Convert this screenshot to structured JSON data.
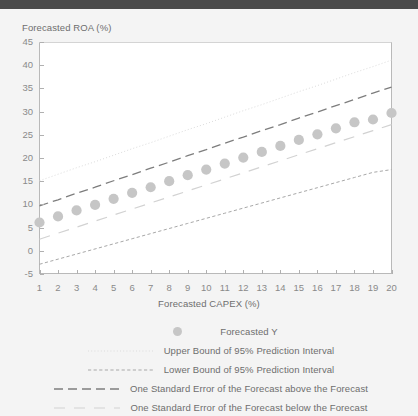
{
  "window": {
    "titlebar_color": "#4a4a4a",
    "background_color": "#f4f4f4"
  },
  "chart_data": {
    "type": "scatter",
    "title": "",
    "xlabel": "Forecasted CAPEX (%)",
    "ylabel": "Forecasted ROA (%)",
    "xlim": [
      1,
      20
    ],
    "ylim": [
      -5,
      45
    ],
    "ytick_labels": [
      "45",
      "40",
      "35",
      "30",
      "25",
      "20",
      "15",
      "10",
      "5",
      "0",
      "-5"
    ],
    "ytick_values": [
      45,
      40,
      35,
      30,
      25,
      20,
      15,
      10,
      5,
      0,
      -5
    ],
    "xtick_labels": [
      "1",
      "2",
      "3",
      "4",
      "5",
      "6",
      "7",
      "8",
      "9",
      "10",
      "11",
      "12",
      "13",
      "14",
      "15",
      "16",
      "17",
      "18",
      "19",
      "20"
    ],
    "xtick_values": [
      1,
      2,
      3,
      4,
      5,
      6,
      7,
      8,
      9,
      10,
      11,
      12,
      13,
      14,
      15,
      16,
      17,
      18,
      19,
      20
    ],
    "grid": false,
    "legend_position": "bottom",
    "x": [
      1,
      2,
      3,
      4,
      5,
      6,
      7,
      8,
      9,
      10,
      11,
      12,
      13,
      14,
      15,
      16,
      17,
      18,
      19,
      20
    ],
    "series": [
      {
        "name": "Forecasted Y",
        "style": "markers",
        "marker": "circle",
        "color": "#c6c6c6",
        "values": [
          6.1,
          7.4,
          8.7,
          9.9,
          11.2,
          12.5,
          13.7,
          15.0,
          16.3,
          17.5,
          18.8,
          20.1,
          21.3,
          22.6,
          23.9,
          25.1,
          26.4,
          27.7,
          28.3,
          29.7
        ]
      },
      {
        "name": "Upper Bound of 95% Prediction Interval",
        "style": "dotted",
        "color": "#dcdcdc",
        "values": [
          15.1,
          16.5,
          17.9,
          19.2,
          20.6,
          22.0,
          23.3,
          24.7,
          26.1,
          27.4,
          28.8,
          30.2,
          31.5,
          32.9,
          34.3,
          35.6,
          37.0,
          38.4,
          39.7,
          41.1
        ]
      },
      {
        "name": "Lower Bound of 95% Prediction Interval",
        "style": "dashed-fine",
        "color": "#a8a8a8",
        "values": [
          -2.9,
          -1.8,
          -0.7,
          0.4,
          1.5,
          2.6,
          3.7,
          4.8,
          5.9,
          7.0,
          8.1,
          9.2,
          10.3,
          11.4,
          12.5,
          13.6,
          14.7,
          15.8,
          16.9,
          17.5
        ]
      },
      {
        "name": "One Standard Error of the Forecast above the Forecast",
        "style": "dashed-long",
        "color": "#7d7d7d",
        "values": [
          9.7,
          11.0,
          12.4,
          13.7,
          15.1,
          16.4,
          17.8,
          19.1,
          20.5,
          21.8,
          23.2,
          24.5,
          25.9,
          27.2,
          28.6,
          29.9,
          31.3,
          32.6,
          34.0,
          35.3
        ]
      },
      {
        "name": "One Standard Error of the Forecast below the Forecast",
        "style": "dashed-sparse",
        "color": "#d2d2d2",
        "values": [
          2.5,
          3.8,
          5.1,
          6.4,
          7.7,
          9.0,
          10.3,
          11.6,
          12.9,
          14.2,
          15.5,
          16.8,
          18.1,
          19.4,
          20.7,
          22.0,
          23.3,
          24.6,
          25.9,
          27.2
        ]
      }
    ],
    "legend": [
      {
        "label": "Forecasted Y",
        "swatch": "circle-marker",
        "color": "#c6c6c6"
      },
      {
        "label": "Upper Bound of 95% Prediction Interval",
        "swatch": "dotted-line",
        "color": "#dcdcdc"
      },
      {
        "label": "Lower Bound of 95% Prediction Interval",
        "swatch": "dashed-fine-line",
        "color": "#a8a8a8"
      },
      {
        "label": "One Standard Error of the Forecast above the Forecast",
        "swatch": "dashed-long-line",
        "color": "#7d7d7d"
      },
      {
        "label": "One Standard Error of the Forecast below the Forecast",
        "swatch": "dashed-sparse-line",
        "color": "#d2d2d2"
      }
    ]
  }
}
